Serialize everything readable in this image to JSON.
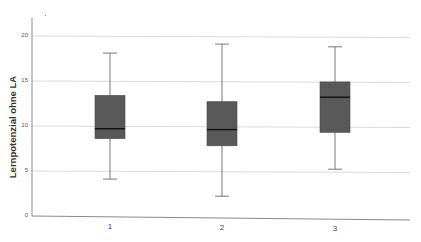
{
  "chart_data": {
    "type": "box",
    "title": "",
    "xlabel": "",
    "ylabel": "Lernpotenzial ohne LA",
    "ylim": [
      0,
      20
    ],
    "yticks": [
      0,
      5,
      10,
      15,
      20
    ],
    "grid": true,
    "categories": [
      "1",
      "2",
      "3"
    ],
    "boxes": [
      {
        "category": "1",
        "whisker_low": 4.1,
        "q1": 8.6,
        "median": 9.7,
        "q3": 13.4,
        "whisker_high": 18.1
      },
      {
        "category": "2",
        "whisker_low": 2.2,
        "q1": 7.8,
        "median": 9.6,
        "q3": 12.7,
        "whisker_high": 19.1
      },
      {
        "category": "3",
        "whisker_low": 5.2,
        "q1": 9.3,
        "median": 13.2,
        "q3": 14.9,
        "whisker_high": 18.8
      }
    ],
    "box_color": "#595959",
    "median_color": "#111111",
    "whisker_color": "#777777",
    "grid_color": "#d0d0d0"
  },
  "axis": {
    "ylabel": "Lernpotenzial ohne LA",
    "yticks": [
      "0",
      "5",
      "10",
      "15",
      "20"
    ],
    "xticks": [
      "1",
      "2",
      "3"
    ]
  }
}
